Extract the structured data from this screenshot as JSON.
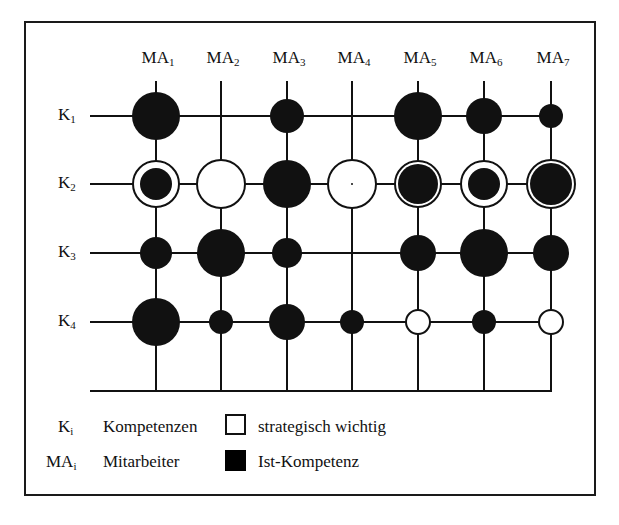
{
  "chart_data": {
    "type": "matrix-bubble",
    "title": "",
    "columns": [
      {
        "base": "MA",
        "sub": "1"
      },
      {
        "base": "MA",
        "sub": "2"
      },
      {
        "base": "MA",
        "sub": "3"
      },
      {
        "base": "MA",
        "sub": "4"
      },
      {
        "base": "MA",
        "sub": "5"
      },
      {
        "base": "MA",
        "sub": "6"
      },
      {
        "base": "MA",
        "sub": "7"
      }
    ],
    "rows": [
      {
        "base": "K",
        "sub": "1"
      },
      {
        "base": "K",
        "sub": "2"
      },
      {
        "base": "K",
        "sub": "3"
      },
      {
        "base": "K",
        "sub": "4"
      }
    ],
    "cells": [
      [
        {
          "ist": 24,
          "strat": 0
        },
        {
          "ist": 0,
          "strat": 0
        },
        {
          "ist": 17,
          "strat": 0
        },
        {
          "ist": 0,
          "strat": 0
        },
        {
          "ist": 24,
          "strat": 0
        },
        {
          "ist": 18,
          "strat": 0
        },
        {
          "ist": 12,
          "strat": 0
        }
      ],
      [
        {
          "ist": 16,
          "strat": 23
        },
        {
          "ist": 0,
          "strat": 24
        },
        {
          "ist": 24,
          "strat": 0
        },
        {
          "ist": 1,
          "strat": 24
        },
        {
          "ist": 20,
          "strat": 23
        },
        {
          "ist": 16,
          "strat": 23
        },
        {
          "ist": 21,
          "strat": 24
        }
      ],
      [
        {
          "ist": 16,
          "strat": 0
        },
        {
          "ist": 24,
          "strat": 0
        },
        {
          "ist": 15,
          "strat": 0
        },
        {
          "ist": 0,
          "strat": 0
        },
        {
          "ist": 18,
          "strat": 0
        },
        {
          "ist": 24,
          "strat": 0
        },
        {
          "ist": 18,
          "strat": 0
        }
      ],
      [
        {
          "ist": 24,
          "strat": 0
        },
        {
          "ist": 12,
          "strat": 0
        },
        {
          "ist": 18,
          "strat": 0
        },
        {
          "ist": 12,
          "strat": 0
        },
        {
          "ist": 0,
          "strat": 12
        },
        {
          "ist": 12,
          "strat": 0
        },
        {
          "ist": 0,
          "strat": 12
        }
      ]
    ],
    "legend": [
      {
        "symbol": "white-square",
        "label": "strategisch wichtig"
      },
      {
        "symbol": "black-square",
        "label": "Ist-Kompetenz"
      }
    ]
  },
  "legend": {
    "k_symbol": {
      "base": "K",
      "sub": "i"
    },
    "k_text": "Kompetenzen",
    "ma_symbol": {
      "base": "MA",
      "sub": "i"
    },
    "ma_text": "Mitarbeiter",
    "strat_label": "strategisch wichtig",
    "ist_label": "Ist-Kompetenz"
  },
  "colors": {
    "ink": "#111111",
    "background": "#ffffff"
  }
}
